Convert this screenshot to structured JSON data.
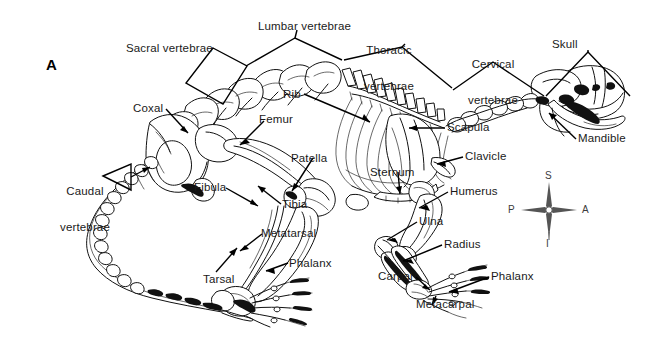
{
  "figure": {
    "panel_letter": "A",
    "background_color": "#ffffff",
    "ink_color": "#111111"
  },
  "labels": [
    {
      "id": "sacral-vertebrae",
      "text": "Sacral vertebrae",
      "lines": [
        "Sacral vertebrae"
      ],
      "x": 126,
      "y": 42,
      "align": "left"
    },
    {
      "id": "lumbar-vertebrae",
      "text": "Lumbar vertebrae",
      "lines": [
        "Lumbar vertebrae"
      ],
      "x": 258,
      "y": 20,
      "align": "left"
    },
    {
      "id": "thoracic-vertebrae",
      "text": "Thoracic vertebrae",
      "lines": [
        "Thoracic",
        "vertebrae"
      ],
      "x": 388,
      "y": 20,
      "align": "center"
    },
    {
      "id": "cervical-vertebrae",
      "text": "Cervical vertebrae",
      "lines": [
        "Cervical",
        "vertebrae"
      ],
      "x": 463,
      "y": 34,
      "align": "center"
    },
    {
      "id": "skull",
      "text": "Skull",
      "lines": [
        "Skull"
      ],
      "x": 552,
      "y": 38,
      "align": "left"
    },
    {
      "id": "mandible",
      "text": "Mandible",
      "lines": [
        "Mandible"
      ],
      "x": 578,
      "y": 132,
      "align": "left"
    },
    {
      "id": "scapula",
      "text": "Scapula",
      "lines": [
        "Scapula"
      ],
      "x": 447,
      "y": 121,
      "align": "left"
    },
    {
      "id": "clavicle",
      "text": "Clavicle",
      "lines": [
        "Clavicle"
      ],
      "x": 465,
      "y": 150,
      "align": "left"
    },
    {
      "id": "humerus",
      "text": "Humerus",
      "lines": [
        "Humerus"
      ],
      "x": 450,
      "y": 185,
      "align": "left"
    },
    {
      "id": "ulna",
      "text": "Ulna",
      "lines": [
        "Ulna"
      ],
      "x": 419,
      "y": 215,
      "align": "left"
    },
    {
      "id": "radius",
      "text": "Radius",
      "lines": [
        "Radius"
      ],
      "x": 444,
      "y": 238,
      "align": "left"
    },
    {
      "id": "carpal",
      "text": "Carpal",
      "lines": [
        "Carpal"
      ],
      "x": 378,
      "y": 270,
      "align": "left"
    },
    {
      "id": "metacarpal",
      "text": "Metacarpal",
      "lines": [
        "Metacarpal"
      ],
      "x": 416,
      "y": 298,
      "align": "left"
    },
    {
      "id": "phalanx-fore",
      "text": "Phalanx",
      "lines": [
        "Phalanx"
      ],
      "x": 491,
      "y": 270,
      "align": "left"
    },
    {
      "id": "sternum",
      "text": "Sternum",
      "lines": [
        "Sternum"
      ],
      "x": 370,
      "y": 166,
      "align": "left"
    },
    {
      "id": "rib",
      "text": "Rib",
      "lines": [
        "Rib"
      ],
      "x": 283,
      "y": 88,
      "align": "left"
    },
    {
      "id": "coxal",
      "text": "Coxal",
      "lines": [
        "Coxal"
      ],
      "x": 133,
      "y": 102,
      "align": "left"
    },
    {
      "id": "femur",
      "text": "Femur",
      "lines": [
        "Femur"
      ],
      "x": 259,
      "y": 113,
      "align": "left"
    },
    {
      "id": "patella",
      "text": "Patella",
      "lines": [
        "Patella"
      ],
      "x": 291,
      "y": 152,
      "align": "left"
    },
    {
      "id": "fibula",
      "text": "Fibula",
      "lines": [
        "Fibula"
      ],
      "x": 194,
      "y": 181,
      "align": "left"
    },
    {
      "id": "tibia",
      "text": "Tibia",
      "lines": [
        "Tibia"
      ],
      "x": 282,
      "y": 198,
      "align": "left"
    },
    {
      "id": "metatarsal",
      "text": "Metatarsal",
      "lines": [
        "Metatarsal"
      ],
      "x": 261,
      "y": 227,
      "align": "left"
    },
    {
      "id": "phalanx-hind",
      "text": "Phalanx",
      "lines": [
        "Phalanx"
      ],
      "x": 289,
      "y": 257,
      "align": "left"
    },
    {
      "id": "tarsal",
      "text": "Tarsal",
      "lines": [
        "Tarsal"
      ],
      "x": 203,
      "y": 273,
      "align": "left"
    },
    {
      "id": "caudal-vertebrae",
      "text": "Caudal vertebrae",
      "lines": [
        "Caudal",
        "vertebrae"
      ],
      "x": 57,
      "y": 161,
      "align": "center"
    }
  ],
  "orientation_compass": {
    "name": "anatomical-orientation-indicator",
    "center_x": 549,
    "center_y": 210,
    "directions": [
      {
        "id": "superior",
        "abbr": "S",
        "position": "top"
      },
      {
        "id": "inferior",
        "abbr": "I",
        "position": "bottom"
      },
      {
        "id": "posterior",
        "abbr": "P",
        "position": "left"
      },
      {
        "id": "anterior",
        "abbr": "A",
        "position": "right"
      }
    ]
  }
}
